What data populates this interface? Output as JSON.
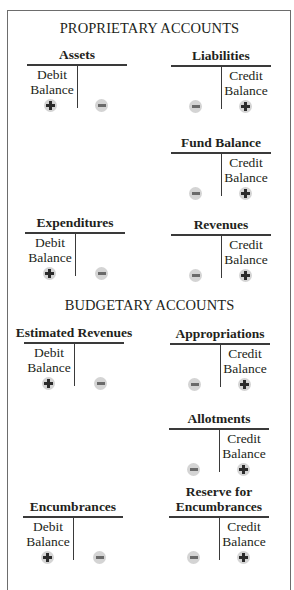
{
  "sections": [
    {
      "title": "PROPRIETARY ACCOUNTS",
      "accounts": [
        {
          "name": "Assets",
          "balance_label_1": "Debit",
          "balance_label_2": "Balance",
          "balance_side": "debit",
          "debit_sign": "+",
          "credit_sign": "−"
        },
        {
          "name": "Liabilities",
          "balance_label_1": "Credit",
          "balance_label_2": "Balance",
          "balance_side": "credit",
          "debit_sign": "−",
          "credit_sign": "+"
        },
        {
          "name": "Fund Balance",
          "balance_label_1": "Credit",
          "balance_label_2": "Balance",
          "balance_side": "credit",
          "debit_sign": "−",
          "credit_sign": "+"
        },
        {
          "name": "Expenditures",
          "balance_label_1": "Debit",
          "balance_label_2": "Balance",
          "balance_side": "debit",
          "debit_sign": "+",
          "credit_sign": "−"
        },
        {
          "name": "Revenues",
          "balance_label_1": "Credit",
          "balance_label_2": "Balance",
          "balance_side": "credit",
          "debit_sign": "−",
          "credit_sign": "+"
        }
      ]
    },
    {
      "title": "BUDGETARY ACCOUNTS",
      "accounts": [
        {
          "name": "Estimated Revenues",
          "balance_label_1": "Debit",
          "balance_label_2": "Balance",
          "balance_side": "debit",
          "debit_sign": "+",
          "credit_sign": "−"
        },
        {
          "name": "Appropriations",
          "balance_label_1": "Credit",
          "balance_label_2": "Balance",
          "balance_side": "credit",
          "debit_sign": "−",
          "credit_sign": "+"
        },
        {
          "name": "Allotments",
          "balance_label_1": "Credit",
          "balance_label_2": "Balance",
          "balance_side": "credit",
          "debit_sign": "−",
          "credit_sign": "+"
        },
        {
          "name": "Encumbrances",
          "balance_label_1": "Debit",
          "balance_label_2": "Balance",
          "balance_side": "debit",
          "debit_sign": "+",
          "credit_sign": "−"
        },
        {
          "name_line_1": "Reserve for",
          "name_line_2": "Encumbrances",
          "balance_label_1": "Credit",
          "balance_label_2": "Balance",
          "balance_side": "credit",
          "debit_sign": "−",
          "credit_sign": "+"
        }
      ]
    }
  ],
  "colors": {
    "frame": "#6d6d6d",
    "lines": "#3a3a3a",
    "sign_circle": "#d4d4d4",
    "sign_glyph": "#2b2b2b"
  }
}
